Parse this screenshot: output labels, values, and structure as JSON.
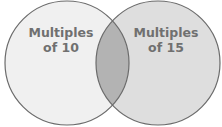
{
  "diagram": {
    "type": "venn",
    "sets": [
      {
        "label_line1": "Multiples",
        "label_line2": "of 10",
        "fill": "#f0f0f0"
      },
      {
        "label_line1": "Multiples",
        "label_line2": "of 15",
        "fill": "#dedede"
      }
    ],
    "intersection_fill": "#b3b3b3",
    "stroke": "#6b6b6b",
    "text_color": "#707070"
  }
}
